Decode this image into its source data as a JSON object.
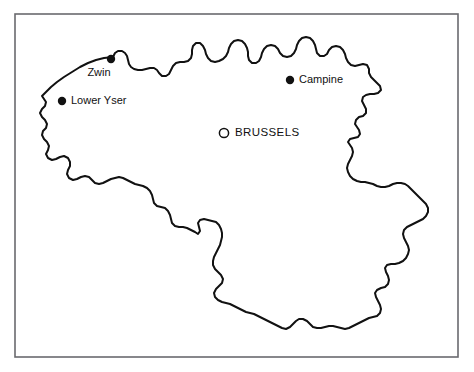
{
  "figure": {
    "background_color": "#ffffff",
    "frame_color": "#6a6a6e",
    "outline_color": "#111111",
    "width": 474,
    "height": 372
  },
  "map": {
    "country": "Belgium",
    "frame": {
      "x": 15,
      "y": 14,
      "width": 443,
      "height": 343
    },
    "places": [
      {
        "id": "zwin",
        "label": "Zwin",
        "marker": "filled-dot",
        "marker_x": 111,
        "marker_y": 59,
        "marker_r": 4.2,
        "label_x": 99,
        "label_y": 73,
        "anchor": "middle"
      },
      {
        "id": "lower-yser",
        "label": "Lower Yser",
        "marker": "filled-dot",
        "marker_x": 62,
        "marker_y": 101,
        "marker_r": 4.2,
        "label_x": 71,
        "label_y": 101,
        "anchor": "start"
      },
      {
        "id": "campine",
        "label": "Campine",
        "marker": "filled-dot",
        "marker_x": 290,
        "marker_y": 80,
        "marker_r": 4.2,
        "label_x": 299,
        "label_y": 80,
        "anchor": "start"
      },
      {
        "id": "brussels",
        "label": "BRUSSELS",
        "marker": "open-circle",
        "marker_x": 224,
        "marker_y": 133,
        "marker_r": 4.6,
        "label_x": 235,
        "label_y": 133,
        "anchor": "start"
      }
    ],
    "outline_path": "M 113 57 L 104 58 L 96 60 L 88 63 L 80 67 L 72 72 L 64 77 L 57 82 L 51 87 L 46 92 L 42 96 L 44 99 L 46 102 L 45 106 L 42 109 L 40 113 L 42 117 L 45 120 L 47 124 L 46 128 L 43 131 L 42 135 L 44 139 L 47 142 L 49 146 L 48 150 L 46 154 L 48 158 L 52 160 L 56 159 L 60 157 L 64 156 L 68 158 L 70 162 L 70 166 L 68 170 L 67 174 L 69 178 L 73 180 L 77 179 L 81 177 L 85 176 L 89 177 L 92 180 L 95 183 L 99 184 L 103 183 L 107 181 L 111 179 L 115 178 L 119 177 L 123 178 L 127 180 L 131 182 L 135 184 L 139 185 L 143 186 L 147 188 L 150 191 L 152 195 L 153 199 L 154 203 L 157 206 L 161 207 L 165 208 L 168 211 L 170 215 L 171 219 L 172 223 L 175 226 L 179 227 L 183 227 L 187 228 L 191 230 L 195 232 L 198 234 L 200 231 L 199 227 L 198 223 L 200 220 L 204 219 L 208 220 L 212 221 L 216 222 L 219 225 L 221 229 L 222 233 L 222 237 L 221 241 L 220 245 L 218 249 L 216 253 L 214 257 L 213 261 L 213 265 L 215 269 L 218 272 L 221 275 L 223 279 L 222 283 L 219 286 L 216 289 L 214 293 L 215 297 L 218 300 L 222 302 L 226 303 L 230 304 L 234 306 L 238 308 L 242 310 L 246 312 L 250 313 L 254 314 L 258 316 L 262 318 L 266 320 L 270 322 L 274 324 L 278 326 L 282 328 L 286 329 L 290 327 L 293 324 L 296 321 L 299 319 L 303 319 L 307 321 L 310 324 L 313 327 L 317 328 L 321 328 L 325 327 L 329 326 L 333 326 L 337 327 L 341 328 L 345 329 L 349 328 L 353 326 L 357 324 L 361 322 L 365 320 L 369 318 L 373 317 L 377 316 L 380 313 L 381 309 L 380 305 L 378 301 L 376 297 L 375 293 L 377 290 L 381 288 L 385 287 L 388 284 L 389 280 L 388 276 L 386 272 L 385 268 L 387 265 L 391 264 L 395 264 L 399 263 L 403 261 L 406 258 L 408 254 L 409 250 L 408 246 L 406 242 L 404 238 L 403 234 L 404 230 L 407 227 L 411 225 L 415 223 L 419 221 L 423 219 L 426 216 L 428 212 L 428 208 L 426 204 L 423 201 L 420 198 L 417 195 L 414 192 L 411 189 L 408 186 L 405 184 L 401 183 L 397 183 L 393 184 L 389 186 L 385 187 L 381 187 L 377 186 L 373 184 L 369 183 L 365 182 L 361 182 L 357 181 L 353 179 L 350 176 L 348 172 L 347 168 L 348 164 L 350 160 L 352 156 L 353 152 L 352 148 L 350 145 L 348 142 L 350 139 L 354 138 L 358 137 L 360 134 L 359 130 L 357 127 L 355 124 L 356 120 L 359 117 L 363 116 L 366 113 L 366 109 L 364 105 L 362 101 L 363 97 L 366 95 L 370 94 L 374 94 L 378 93 L 381 90 L 380 86 L 377 83 L 374 80 L 371 77 L 369 73 L 369 69 L 367 65 L 363 64 L 359 65 L 355 66 L 351 65 L 348 62 L 346 58 L 345 54 L 343 50 L 340 47 L 336 46 L 332 47 L 329 50 L 327 54 L 324 56 L 320 56 L 317 53 L 316 49 L 315 45 L 313 41 L 310 38 L 306 37 L 302 38 L 299 41 L 297 45 L 296 49 L 294 53 L 291 56 L 287 57 L 283 56 L 280 53 L 278 49 L 275 46 L 271 45 L 267 46 L 264 49 L 262 53 L 261 57 L 259 61 L 256 63 L 252 63 L 249 60 L 248 56 L 248 52 L 247 48 L 245 44 L 242 41 L 238 40 L 234 41 L 231 44 L 229 48 L 228 52 L 226 56 L 223 59 L 219 61 L 215 62 L 211 61 L 208 58 L 206 54 L 205 50 L 203 46 L 200 43 L 196 43 L 193 46 L 192 50 L 192 54 L 191 58 L 188 61 L 184 62 L 180 62 L 176 63 L 173 66 L 171 70 L 169 74 L 166 76 L 162 76 L 159 73 L 157 70 L 154 68 L 150 68 L 146 69 L 142 70 L 138 70 L 134 69 L 131 67 L 129 64 L 128 60 L 127 56 L 125 53 L 122 51 L 118 51 L 115 53 Z"
  }
}
